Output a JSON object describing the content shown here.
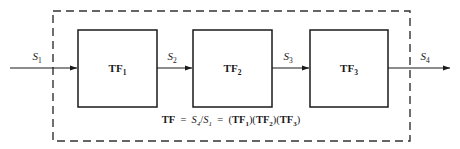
{
  "diagram": {
    "boundary": {
      "style": "dashed",
      "color": "#333333",
      "label": "system-boundary"
    },
    "colors": {
      "line": "#1a1a1a",
      "box_border": "#1a1a1a",
      "box_fill": "#ffffff",
      "background": "#ffffff",
      "dash": "#333333"
    },
    "blocks": [
      {
        "id": "tf1",
        "name": "TF",
        "subscript": "1",
        "full": "TF1"
      },
      {
        "id": "tf2",
        "name": "TF",
        "subscript": "2",
        "full": "TF2"
      },
      {
        "id": "tf3",
        "name": "TF",
        "subscript": "3",
        "full": "TF3"
      }
    ],
    "signals": [
      {
        "id": "s1",
        "name": "S",
        "subscript": "1",
        "full": "S1",
        "role": "input"
      },
      {
        "id": "s2",
        "name": "S",
        "subscript": "2",
        "full": "S2",
        "role": "intermediate"
      },
      {
        "id": "s3",
        "name": "S",
        "subscript": "3",
        "full": "S3",
        "role": "intermediate"
      },
      {
        "id": "s4",
        "name": "S",
        "subscript": "4",
        "full": "S4",
        "role": "output"
      }
    ],
    "formula": {
      "lhs": "TF",
      "eq1": "=",
      "ratio_num": "S",
      "ratio_num_sub": "4",
      "slash": "/",
      "ratio_den": "S",
      "ratio_den_sub": "1",
      "eq2": "=",
      "product": "(TF1)(TF2)(TF3)",
      "plain": "TF = S4/S1 = (TF1)(TF2)(TF3)"
    }
  }
}
